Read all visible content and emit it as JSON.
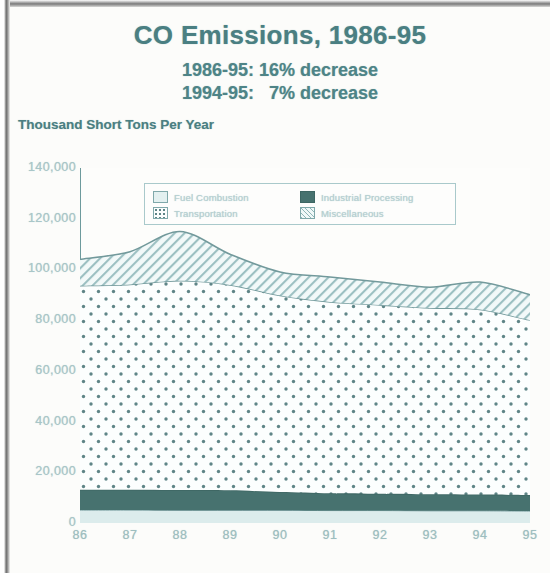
{
  "chart_data": {
    "type": "area",
    "title": "CO Emissions, 1986-95",
    "subtitle_1": "1986-95: 16% decrease",
    "subtitle_2": "1994-95:   7% decrease",
    "ylabel": "Thousand Short Tons Per Year",
    "xlabel": "",
    "stacked": true,
    "grid": false,
    "legend_position": "inside-top",
    "categories": [
      "86",
      "87",
      "88",
      "89",
      "90",
      "91",
      "92",
      "93",
      "94",
      "95"
    ],
    "x_tick_labels": [
      "86",
      "87",
      "88",
      "89",
      "90",
      "91",
      "92",
      "93",
      "94",
      "95"
    ],
    "y_tick_labels": [
      "140,000",
      "120,000",
      "100,000",
      "80,000",
      "60,000",
      "40,000",
      "20,000",
      "0"
    ],
    "y_tick_values": [
      140000,
      120000,
      100000,
      80000,
      60000,
      40000,
      20000,
      0
    ],
    "ylim": [
      0,
      140000
    ],
    "series": [
      {
        "name": "Fuel Combustion",
        "pattern": "solid-light",
        "color": "#dcecec",
        "values": [
          5100,
          5100,
          5000,
          5000,
          5000,
          4900,
          4900,
          4800,
          4800,
          4700
        ]
      },
      {
        "name": "Industrial Processing",
        "pattern": "solid-dark",
        "color": "#47726f",
        "values": [
          8000,
          8000,
          8000,
          7900,
          7200,
          6800,
          6600,
          6500,
          6400,
          6300
        ]
      },
      {
        "name": "Transportation",
        "pattern": "dotted",
        "color": "#fbfdfd",
        "values": [
          80500,
          81000,
          82500,
          81000,
          77500,
          75500,
          74500,
          73500,
          73000,
          69000
        ]
      },
      {
        "name": "Miscellaneous",
        "pattern": "diagonal-hatch",
        "color": "#eff7f7",
        "values": [
          10400,
          12900,
          19500,
          12100,
          9300,
          9800,
          9000,
          8200,
          10800,
          10000
        ]
      }
    ],
    "totals": [
      104000,
      107000,
      115000,
      106000,
      99000,
      97000,
      95000,
      93000,
      95000,
      90000
    ],
    "legend_entries": [
      {
        "label": "Fuel Combustion",
        "pattern": "solid-light"
      },
      {
        "label": "Industrial Processing",
        "pattern": "solid-dark"
      },
      {
        "label": "Transportation",
        "pattern": "dotted"
      },
      {
        "label": "Miscellaneous",
        "pattern": "diagonal-hatch"
      }
    ],
    "colors": {
      "ink": "#4a7f82",
      "axis": "#6d9a9c",
      "tick_text": "#a8c6c8",
      "dark_band": "#47726f",
      "light_band": "#dcecec",
      "paper": "#fdfdfb"
    }
  }
}
